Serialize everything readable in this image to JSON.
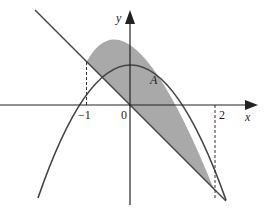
{
  "figure": {
    "region_label": "A",
    "axes": {
      "x_label": "x",
      "y_label": "y"
    },
    "tick_labels": {
      "neg_one": "−1",
      "zero": "0",
      "two": "2"
    },
    "curves": [
      {
        "name": "parabola",
        "equation": "y = 2 - x^2"
      },
      {
        "name": "line",
        "equation": "y = -x"
      }
    ],
    "intersections": [
      {
        "x": -1,
        "y": 1
      },
      {
        "x": 2,
        "y": -2
      }
    ],
    "colors": {
      "shade": "#a9a9a9",
      "stroke": "#444444",
      "axis": "#222222"
    }
  }
}
